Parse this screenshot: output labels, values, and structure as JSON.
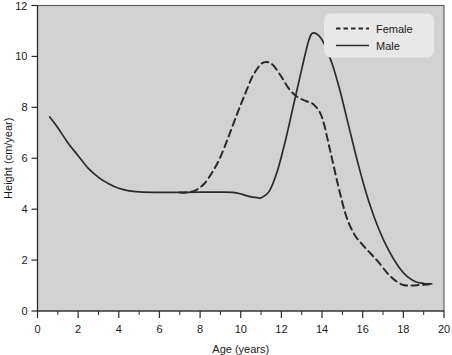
{
  "chart_data": {
    "type": "line",
    "title": "",
    "xlabel": "Age (years)",
    "ylabel": "Height (cm/year)",
    "xlim": [
      0,
      20
    ],
    "ylim": [
      0,
      12
    ],
    "xticks": [
      0,
      2,
      4,
      6,
      8,
      10,
      12,
      14,
      16,
      18,
      20
    ],
    "yticks": [
      0,
      2,
      4,
      6,
      8,
      10,
      12
    ],
    "xtick_labels": [
      "0",
      "2",
      "4",
      "6",
      "8",
      "10",
      "12",
      "14",
      "16",
      "18",
      "20"
    ],
    "ytick_labels": [
      "0",
      "2",
      "4",
      "6",
      "8",
      "10",
      "12"
    ],
    "x_minor_tick_step": 1,
    "grid": false,
    "legend_position": "top-right",
    "plot_background": "#d2d2d2",
    "line_color": "#2a2a2a",
    "series": [
      {
        "name": "Female",
        "style": "dashed",
        "x": [
          7.0,
          7.4,
          7.8,
          8.2,
          8.6,
          9.0,
          9.4,
          9.8,
          10.2,
          10.6,
          11.0,
          11.3,
          11.6,
          12.0,
          12.4,
          12.8,
          13.2,
          13.6,
          14.0,
          14.4,
          14.8,
          15.2,
          15.6,
          16.0,
          16.4,
          16.8,
          17.2,
          17.6,
          18.0,
          18.4,
          18.8,
          19.3
        ],
        "y": [
          4.65,
          4.66,
          4.75,
          5.0,
          5.45,
          6.05,
          6.85,
          7.7,
          8.5,
          9.25,
          9.7,
          9.78,
          9.65,
          9.2,
          8.7,
          8.4,
          8.25,
          8.1,
          7.6,
          6.3,
          4.9,
          3.7,
          3.0,
          2.6,
          2.25,
          1.9,
          1.5,
          1.2,
          1.02,
          1.0,
          1.02,
          1.05
        ]
      },
      {
        "name": "Male",
        "style": "solid",
        "x": [
          0.6,
          1.0,
          1.5,
          2.0,
          2.5,
          3.0,
          3.5,
          4.0,
          4.5,
          5.0,
          6.0,
          7.0,
          8.0,
          9.0,
          9.6,
          10.0,
          10.4,
          10.8,
          11.0,
          11.4,
          11.8,
          12.2,
          12.6,
          13.0,
          13.3,
          13.5,
          13.8,
          14.1,
          14.5,
          14.9,
          15.3,
          15.8,
          16.3,
          16.8,
          17.3,
          17.8,
          18.2,
          18.6,
          19.0,
          19.4
        ],
        "y": [
          7.62,
          7.2,
          6.6,
          6.1,
          5.6,
          5.25,
          5.0,
          4.82,
          4.72,
          4.68,
          4.66,
          4.66,
          4.67,
          4.67,
          4.66,
          4.6,
          4.5,
          4.45,
          4.45,
          4.7,
          5.5,
          6.7,
          8.1,
          9.5,
          10.5,
          10.9,
          10.85,
          10.5,
          9.7,
          8.6,
          7.3,
          5.7,
          4.3,
          3.2,
          2.35,
          1.7,
          1.35,
          1.15,
          1.08,
          1.07
        ]
      }
    ],
    "legend": [
      {
        "label": "Female",
        "style": "dashed"
      },
      {
        "label": "Male",
        "style": "solid"
      }
    ]
  },
  "axes": {
    "x_title": "Age (years)",
    "y_title": "Height (cm/year)"
  }
}
